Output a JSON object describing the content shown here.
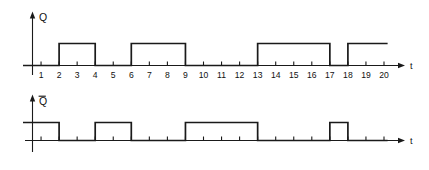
{
  "figure": {
    "title": "",
    "background_color": "#ffffff",
    "stroke_color": "#1a1a1a",
    "time_axis_label": "t"
  },
  "chart_data": {
    "type": "line",
    "subtype": "digital-timing-diagram",
    "title": "",
    "xlabel": "t",
    "ylabel": "",
    "xlim": [
      0,
      21
    ],
    "ylim": [
      0,
      1
    ],
    "grid": false,
    "legend_position": "none",
    "x_tick_labels": [
      "1",
      "2",
      "3",
      "4",
      "5",
      "6",
      "7",
      "8",
      "9",
      "10",
      "11",
      "12",
      "13",
      "14",
      "15",
      "16",
      "17",
      "18",
      "19",
      "20"
    ],
    "x_tick_values": [
      1,
      2,
      3,
      4,
      5,
      6,
      7,
      8,
      9,
      10,
      11,
      12,
      13,
      14,
      15,
      16,
      17,
      18,
      19,
      20
    ],
    "series": [
      {
        "name": "Q",
        "label": "Q",
        "overbar": false,
        "show_tick_labels": true,
        "levels": [
          {
            "from": 0,
            "to": 2,
            "value": 0
          },
          {
            "from": 2,
            "to": 4,
            "value": 1
          },
          {
            "from": 4,
            "to": 6,
            "value": 0
          },
          {
            "from": 6,
            "to": 9,
            "value": 1
          },
          {
            "from": 9,
            "to": 13,
            "value": 0
          },
          {
            "from": 13,
            "to": 17,
            "value": 1
          },
          {
            "from": 17,
            "to": 18,
            "value": 0
          },
          {
            "from": 18,
            "to": 20.2,
            "value": 1
          }
        ],
        "high_pulses": [
          [
            2,
            4
          ],
          [
            6,
            9
          ],
          [
            13,
            17
          ],
          [
            18,
            20.2
          ]
        ],
        "ends_high": true
      },
      {
        "name": "Qbar",
        "label": "Q",
        "overbar": true,
        "show_tick_labels": false,
        "levels": [
          {
            "from": 0,
            "to": 2,
            "value": 1
          },
          {
            "from": 2,
            "to": 4,
            "value": 0
          },
          {
            "from": 4,
            "to": 6,
            "value": 1
          },
          {
            "from": 6,
            "to": 9,
            "value": 0
          },
          {
            "from": 9,
            "to": 13,
            "value": 1
          },
          {
            "from": 13,
            "to": 17,
            "value": 0
          },
          {
            "from": 17,
            "to": 18,
            "value": 1
          },
          {
            "from": 18,
            "to": 20.2,
            "value": 0
          }
        ],
        "high_pulses": [
          [
            0,
            2
          ],
          [
            4,
            6
          ],
          [
            9,
            13
          ],
          [
            17,
            18
          ]
        ],
        "ends_high": false
      }
    ]
  },
  "labels": {
    "q": "Q",
    "qbar": "Q",
    "t_top": "t",
    "t_bottom": "t"
  },
  "ticks": {
    "numbers": [
      "1",
      "2",
      "3",
      "4",
      "5",
      "6",
      "7",
      "8",
      "9",
      "10",
      "11",
      "12",
      "13",
      "14",
      "15",
      "16",
      "17",
      "18",
      "19",
      "20"
    ]
  }
}
